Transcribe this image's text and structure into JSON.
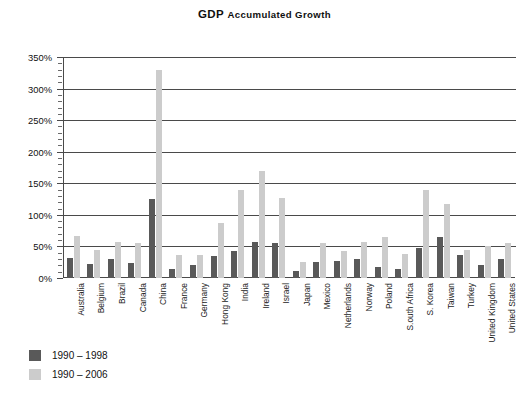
{
  "chart_data": {
    "type": "bar",
    "title": "GDP Accumulated Growth",
    "title_first_word": "GDP ",
    "title_rest": "Accumulated Growth",
    "xlabel": "",
    "ylabel": "",
    "ylim": [
      0,
      350
    ],
    "ytick_labels": [
      "0%",
      "50%",
      "100%",
      "150%",
      "200%",
      "250%",
      "300%",
      "350%"
    ],
    "ytick_values": [
      0,
      50,
      100,
      150,
      200,
      250,
      300,
      350
    ],
    "grid": true,
    "minor_ticks": true,
    "legend_position": "below-left",
    "categories": [
      "Australia",
      "Belgium",
      "Brazil",
      "Canada",
      "China",
      "France",
      "Germany",
      "Hong Kong",
      "India",
      "Ireland",
      "Israel",
      "Japan",
      "Mexico",
      "Netherlands",
      "Norway",
      "Poland",
      "S.outh Africa",
      "S. Korea",
      "Taiwan",
      "Turkey",
      "United Kingdom",
      "United States"
    ],
    "series": [
      {
        "name": "1990 – 1998",
        "color": "#595959",
        "values": [
          32,
          22,
          30,
          23,
          125,
          14,
          21,
          35,
          43,
          57,
          55,
          11,
          25,
          27,
          30,
          17,
          14,
          48,
          65,
          37,
          20,
          30
        ]
      },
      {
        "name": "1990 – 2006",
        "color": "#cccccc",
        "values": [
          67,
          45,
          57,
          56,
          330,
          37,
          36,
          87,
          140,
          170,
          126,
          25,
          56,
          43,
          57,
          65,
          38,
          140,
          118,
          44,
          50,
          55
        ]
      }
    ]
  },
  "legend": {
    "items": [
      {
        "label": "1990 – 1998",
        "color": "#595959"
      },
      {
        "label": "1990 – 2006",
        "color": "#cccccc"
      }
    ]
  }
}
